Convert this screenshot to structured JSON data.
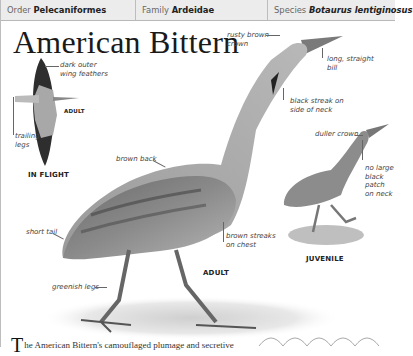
{
  "header": {
    "order_label": "Order",
    "order_value": "Pelecaniformes",
    "family_label": "Family",
    "family_value": "Ardeidae",
    "species_label": "Species",
    "species_value": "Botaurus lentiginosus"
  },
  "title": "American Bittern",
  "flight": {
    "labels": {
      "dark_outer_wing_line1": "dark outer",
      "dark_outer_wing_line2": "wing feathers",
      "trailing_legs_line1": "trailing",
      "trailing_legs_line2": "legs",
      "adult": "ADULT"
    },
    "caption": "IN FLIGHT"
  },
  "adult": {
    "labels": {
      "rusty_crown_line1": "rusty brown",
      "rusty_crown_line2": "crown",
      "bill_line1": "long, straight",
      "bill_line2": "bill",
      "streak_line1": "black streak on",
      "streak_line2": "side of neck",
      "brown_back": "brown back",
      "short_tail": "short tail",
      "chest_line1": "brown streaks",
      "chest_line2": "on chest",
      "legs": "greenish legs"
    },
    "caption": "ADULT"
  },
  "juvenile": {
    "labels": {
      "duller_crown": "duller crown",
      "patch_line1": "no large",
      "patch_line2": "black",
      "patch_line3": "patch",
      "patch_line4": "on neck"
    },
    "caption": "JUVENILE"
  },
  "body": {
    "drop_cap": "T",
    "text": "he American Bittern's camouflaged plumage and secretive"
  }
}
